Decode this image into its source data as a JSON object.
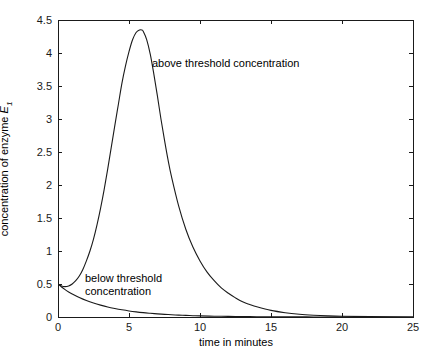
{
  "figure": {
    "background_color": "#ffffff",
    "axis_color": "#1a1a1a",
    "curve_color": "#1a1a1a"
  },
  "chart_data": {
    "type": "line",
    "title": "",
    "xlabel": "time in minutes",
    "ylabel": "concentration of enzyme E1",
    "ylabel_parts": {
      "prefix": "concentration of enzyme ",
      "symbol": "E",
      "subscript": "1"
    },
    "xlim": [
      0,
      25
    ],
    "ylim": [
      0,
      4.5
    ],
    "xticks": [
      0,
      5,
      10,
      15,
      20,
      25
    ],
    "xtick_labels": [
      "0",
      "5",
      "10",
      "15",
      "20",
      "25"
    ],
    "yticks": [
      0,
      0.5,
      1,
      1.5,
      2,
      2.5,
      3,
      3.5,
      4,
      4.5
    ],
    "ytick_labels": [
      "0",
      "0.5",
      "1",
      "1.5",
      "2",
      "2.5",
      "3",
      "3.5",
      "4",
      "4.5"
    ],
    "grid": false,
    "legend": "none",
    "box": true,
    "ticks_all_sides": true,
    "annotations": [
      {
        "name": "above-threshold",
        "text": "above threshold concentration",
        "x": 8.95,
        "y": 3.9
      },
      {
        "name": "below-threshold",
        "text": "below threshold\nconcentration",
        "x": 1.9,
        "y": 0.73
      }
    ],
    "series": [
      {
        "name": "above threshold concentration",
        "initial_value": 0.5,
        "peak_x": 5.9,
        "peak_y": 4.35,
        "x": [
          0,
          0.25,
          0.5,
          0.75,
          1,
          1.25,
          1.5,
          1.75,
          2,
          2.25,
          2.5,
          2.75,
          3,
          3.25,
          3.5,
          3.75,
          4,
          4.25,
          4.5,
          4.75,
          5,
          5.25,
          5.5,
          5.75,
          5.9,
          6,
          6.25,
          6.5,
          6.75,
          7,
          7.25,
          7.5,
          7.75,
          8,
          8.5,
          9,
          9.5,
          10,
          10.5,
          11,
          11.5,
          12,
          12.5,
          13,
          13.5,
          14,
          15,
          16,
          17,
          18,
          19,
          20,
          22,
          25
        ],
        "y": [
          0.5,
          0.47,
          0.46,
          0.47,
          0.5,
          0.55,
          0.62,
          0.72,
          0.85,
          1.0,
          1.18,
          1.4,
          1.65,
          1.93,
          2.24,
          2.57,
          2.9,
          3.22,
          3.54,
          3.8,
          4.02,
          4.2,
          4.31,
          4.35,
          4.35,
          4.33,
          4.2,
          3.98,
          3.68,
          3.35,
          3.0,
          2.68,
          2.38,
          2.12,
          1.68,
          1.33,
          1.06,
          0.85,
          0.68,
          0.55,
          0.44,
          0.36,
          0.29,
          0.23,
          0.19,
          0.155,
          0.1,
          0.065,
          0.042,
          0.027,
          0.017,
          0.011,
          0.005,
          0.001
        ]
      },
      {
        "name": "below threshold concentration",
        "initial_value": 0.5,
        "x": [
          0,
          0.25,
          0.5,
          0.75,
          1,
          1.5,
          2,
          2.5,
          3,
          3.5,
          4,
          4.5,
          5,
          5.5,
          6,
          6.5,
          7,
          7.5,
          8,
          8.5,
          9,
          9.5,
          10,
          11,
          12,
          13,
          14,
          15,
          16,
          17,
          18,
          19,
          20,
          22,
          25
        ],
        "y": [
          0.5,
          0.455,
          0.415,
          0.38,
          0.35,
          0.296,
          0.25,
          0.212,
          0.18,
          0.152,
          0.129,
          0.109,
          0.092,
          0.078,
          0.066,
          0.056,
          0.047,
          0.04,
          0.034,
          0.029,
          0.024,
          0.02,
          0.017,
          0.012,
          0.009,
          0.0065,
          0.0045,
          0.003,
          0.002,
          0.0015,
          0.001,
          0.0007,
          0.0005,
          0.0002,
          0.0001
        ]
      }
    ]
  }
}
